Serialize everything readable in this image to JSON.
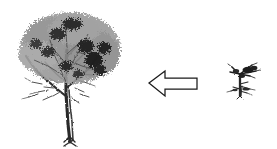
{
  "document": {
    "title": "Tree growth direction diagram",
    "background_color": "#ffffff",
    "width": 277,
    "height": 149
  },
  "figures": [
    {
      "id": "mature-tree",
      "name": "mature-tree-illustration",
      "label": "Mature tree",
      "description": "Detailed pencil-sketch style broadleaf tree with dense dark foliage canopy, thin forking trunk and bare lower branches",
      "ink_color": "#222222",
      "position": {
        "x": 8,
        "y": 4,
        "width": 125,
        "height": 142
      }
    },
    {
      "id": "direction-arrow",
      "name": "left-block-arrow",
      "label": "Left pointing arrow",
      "description": "Outlined block arrow pointing left, white fill with thin black stroke",
      "stroke_color": "#1a1a1a",
      "fill_color": "#ffffff",
      "direction": "left",
      "position": {
        "x": 146,
        "y": 66,
        "width": 54,
        "height": 34
      }
    },
    {
      "id": "sapling",
      "name": "sapling-illustration",
      "label": "Sapling",
      "description": "Small sparse seedling sketch with slender vertical stem and a few thin diagonal branches",
      "ink_color": "#222222",
      "position": {
        "x": 226,
        "y": 58,
        "width": 36,
        "height": 44
      }
    }
  ]
}
